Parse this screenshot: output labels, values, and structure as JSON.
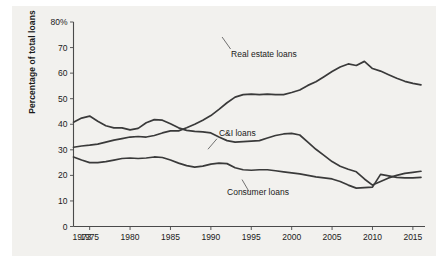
{
  "figure": {
    "background_color": "#f2f1ee",
    "page_color": "#ffffff",
    "line_color": "#3a3a3a",
    "axis_color": "#4a4a4a"
  },
  "chart_data": {
    "type": "line",
    "title": "",
    "subtitle": "",
    "xlabel": "",
    "ylabel": "Percentage of total loans",
    "xlim": [
      1973,
      2016.5
    ],
    "ylim": [
      0,
      80
    ],
    "grid": false,
    "legend_position": "inline-annotations",
    "y_ticks": [
      0,
      10,
      20,
      30,
      40,
      50,
      60,
      70,
      80
    ],
    "y_tick_labels": [
      "0",
      "10",
      "20",
      "30",
      "40",
      "50",
      "60",
      "70",
      "80%"
    ],
    "x_ticks": [
      1973,
      1975,
      1980,
      1985,
      1990,
      1995,
      2000,
      2005,
      2010,
      2015
    ],
    "x_tick_labels": [
      "1973",
      "1975",
      "1980",
      "1985",
      "1990",
      "1995",
      "2000",
      "2005",
      "2010",
      "2015"
    ],
    "annotations": [
      {
        "text": "Real estate loans",
        "x": 1992.5,
        "y": 66.5
      },
      {
        "text": "C&I loans",
        "x": 1991.0,
        "y": 35.5
      },
      {
        "text": "Consumer loans",
        "x": 1992.0,
        "y": 12.5
      }
    ],
    "series": [
      {
        "name": "Real estate loans",
        "x": [
          1973,
          1974,
          1975,
          1976,
          1977,
          1978,
          1979,
          1980,
          1981,
          1982,
          1983,
          1984,
          1985,
          1986,
          1987,
          1988,
          1989,
          1990,
          1991,
          1992,
          1993,
          1994,
          1995,
          1996,
          1997,
          1998,
          1999,
          2000,
          2001,
          2002,
          2003,
          2004,
          2005,
          2006,
          2007,
          2008,
          2009,
          2010,
          2011,
          2012,
          2013,
          2014,
          2015,
          2016
        ],
        "values": [
          31.0,
          31.5,
          31.8,
          32.2,
          33.0,
          33.8,
          34.4,
          35.0,
          35.2,
          35.0,
          35.6,
          36.6,
          37.4,
          37.4,
          38.6,
          40.0,
          41.6,
          43.4,
          45.8,
          48.4,
          50.6,
          51.6,
          51.8,
          51.6,
          51.8,
          51.6,
          51.6,
          52.4,
          53.4,
          55.2,
          56.6,
          58.6,
          60.6,
          62.4,
          63.6,
          63.0,
          64.6,
          61.8,
          60.8,
          59.4,
          58.0,
          56.8,
          56.0,
          55.4
        ]
      },
      {
        "name": "C&I loans",
        "x": [
          1973,
          1974,
          1975,
          1976,
          1977,
          1978,
          1979,
          1980,
          1981,
          1982,
          1983,
          1984,
          1985,
          1986,
          1987,
          1988,
          1989,
          1990,
          1991,
          1992,
          1993,
          1994,
          1995,
          1996,
          1997,
          1998,
          1999,
          2000,
          2001,
          2002,
          2003,
          2004,
          2005,
          2006,
          2007,
          2008,
          2009,
          2010,
          2011,
          2012,
          2013,
          2014,
          2015,
          2016
        ],
        "values": [
          40.8,
          42.4,
          43.2,
          41.2,
          39.4,
          38.6,
          38.6,
          37.8,
          38.4,
          40.6,
          41.8,
          41.6,
          40.2,
          38.6,
          37.6,
          37.2,
          37.0,
          36.6,
          35.0,
          33.6,
          33.0,
          33.2,
          33.4,
          33.6,
          34.6,
          35.6,
          36.2,
          36.4,
          35.8,
          33.0,
          30.2,
          27.8,
          25.4,
          23.6,
          22.4,
          21.4,
          18.6,
          16.2,
          17.6,
          19.0,
          20.0,
          20.8,
          21.2,
          21.6
        ]
      },
      {
        "name": "Consumer loans",
        "x": [
          1973,
          1974,
          1975,
          1976,
          1977,
          1978,
          1979,
          1980,
          1981,
          1982,
          1983,
          1984,
          1985,
          1986,
          1987,
          1988,
          1989,
          1990,
          1991,
          1992,
          1993,
          1994,
          1995,
          1996,
          1997,
          1998,
          1999,
          2000,
          2001,
          2002,
          2003,
          2004,
          2005,
          2006,
          2007,
          2008,
          2009,
          2010,
          2011,
          2012,
          2013,
          2014,
          2015,
          2016
        ],
        "values": [
          27.2,
          26.0,
          25.0,
          25.0,
          25.4,
          26.0,
          26.6,
          26.8,
          26.6,
          26.8,
          27.2,
          27.0,
          26.0,
          24.8,
          23.8,
          23.2,
          23.6,
          24.4,
          24.8,
          24.6,
          23.0,
          22.2,
          22.0,
          22.2,
          22.2,
          21.8,
          21.4,
          21.0,
          20.6,
          20.0,
          19.4,
          19.0,
          18.6,
          17.6,
          16.2,
          15.0,
          15.2,
          15.4,
          20.4,
          19.8,
          19.2,
          19.0,
          19.0,
          19.2
        ]
      }
    ]
  }
}
